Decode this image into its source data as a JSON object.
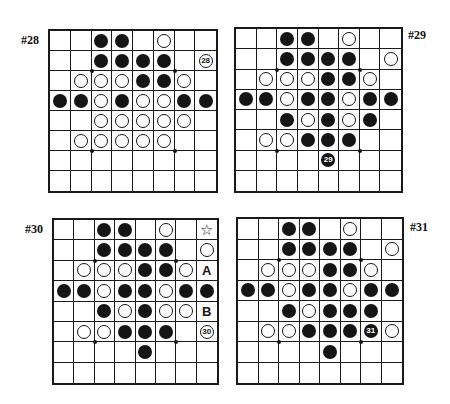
{
  "legend": {
    "B": "black stone",
    "W": "white stone",
    "_": "empty"
  },
  "colors": {
    "ink": "#151515",
    "paper": "#ffffff"
  },
  "diagrams": [
    {
      "id": "28",
      "label": "#28",
      "label_pos": {
        "x": 21,
        "y": 33
      },
      "board_pos": {
        "x": 48,
        "y": 29,
        "w": 170,
        "h": 164
      },
      "rows": [
        [
          "_",
          "_",
          "B",
          "B",
          "_",
          "W",
          "_",
          "_"
        ],
        [
          "_",
          "_",
          "B",
          "B",
          "B",
          "B",
          "_",
          "W:28"
        ],
        [
          "_",
          "W",
          "W",
          "W",
          "B",
          "B",
          "W",
          "_"
        ],
        [
          "B",
          "B",
          "W",
          "B",
          "W",
          "W",
          "B",
          "B"
        ],
        [
          "_",
          "_",
          "W",
          "W",
          "W",
          "W",
          "W",
          "_"
        ],
        [
          "_",
          "W",
          "W",
          "W",
          "W",
          "W",
          "_",
          "_"
        ],
        [
          "_",
          "_",
          "_",
          "_",
          "_",
          "_",
          "_",
          "_"
        ],
        [
          "_",
          "_",
          "_",
          "_",
          "_",
          "_",
          "_",
          "_"
        ]
      ]
    },
    {
      "id": "29",
      "label": "#29",
      "label_pos": {
        "x": 408,
        "y": 28
      },
      "board_pos": {
        "x": 234,
        "y": 27,
        "w": 169,
        "h": 166
      },
      "rows": [
        [
          "_",
          "_",
          "B",
          "B",
          "_",
          "W",
          "_",
          "_"
        ],
        [
          "_",
          "_",
          "B",
          "B",
          "B",
          "B",
          "_",
          "W"
        ],
        [
          "_",
          "W",
          "W",
          "W",
          "B",
          "B",
          "W",
          "_"
        ],
        [
          "B",
          "B",
          "W",
          "B",
          "B",
          "W",
          "B",
          "B"
        ],
        [
          "_",
          "_",
          "B",
          "W",
          "B",
          "W",
          "B",
          "_"
        ],
        [
          "_",
          "W",
          "W",
          "B",
          "B",
          "B",
          "_",
          "_"
        ],
        [
          "_",
          "_",
          "_",
          "_",
          "B:29",
          "_",
          "_",
          "_"
        ],
        [
          "_",
          "_",
          "_",
          "_",
          "_",
          "_",
          "_",
          "_"
        ]
      ]
    },
    {
      "id": "30",
      "label": "#30",
      "label_pos": {
        "x": 25,
        "y": 222
      },
      "board_pos": {
        "x": 52,
        "y": 218,
        "w": 167,
        "h": 167
      },
      "rows": [
        [
          "_",
          "_",
          "B",
          "B",
          "_",
          "W",
          "_",
          "M:☆"
        ],
        [
          "_",
          "_",
          "B",
          "B",
          "B",
          "B",
          "_",
          "W"
        ],
        [
          "_",
          "W",
          "W",
          "W",
          "B",
          "B",
          "W",
          "M:A"
        ],
        [
          "B",
          "B",
          "W",
          "B",
          "B",
          "W",
          "B",
          "B"
        ],
        [
          "_",
          "_",
          "B",
          "W",
          "B",
          "W",
          "W",
          "M:B"
        ],
        [
          "_",
          "W",
          "W",
          "B",
          "B",
          "B",
          "_",
          "W:30"
        ],
        [
          "_",
          "_",
          "_",
          "_",
          "B",
          "_",
          "_",
          "_"
        ],
        [
          "_",
          "_",
          "_",
          "_",
          "_",
          "_",
          "_",
          "_"
        ]
      ]
    },
    {
      "id": "31",
      "label": "#31",
      "label_pos": {
        "x": 410,
        "y": 220
      },
      "board_pos": {
        "x": 236,
        "y": 217,
        "w": 168,
        "h": 168
      },
      "rows": [
        [
          "_",
          "_",
          "B",
          "B",
          "_",
          "W",
          "_",
          "_"
        ],
        [
          "_",
          "_",
          "B",
          "B",
          "B",
          "B",
          "_",
          "W"
        ],
        [
          "_",
          "W",
          "W",
          "W",
          "B",
          "B",
          "W",
          "_"
        ],
        [
          "B",
          "B",
          "W",
          "B",
          "B",
          "W",
          "B",
          "B"
        ],
        [
          "_",
          "_",
          "B",
          "W",
          "B",
          "B",
          "B",
          "_"
        ],
        [
          "_",
          "W",
          "W",
          "B",
          "B",
          "B",
          "B:31",
          "W"
        ],
        [
          "_",
          "_",
          "_",
          "_",
          "B",
          "_",
          "_",
          "_"
        ],
        [
          "_",
          "_",
          "_",
          "_",
          "_",
          "_",
          "_",
          "_"
        ]
      ]
    }
  ]
}
